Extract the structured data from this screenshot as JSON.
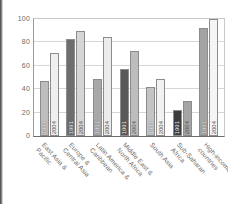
{
  "chart_data": {
    "type": "bar",
    "title": "",
    "xlabel": "",
    "ylabel": "",
    "ylim": [
      0,
      100
    ],
    "yticks": [
      0,
      20,
      40,
      60,
      80,
      100
    ],
    "grid": true,
    "legend_position": "none",
    "categories": [
      "East Asia &\nPacific",
      "Europe &\nCentral Asia",
      "Latin America &\nCaribbean",
      "Middle East &\nNorth Africa",
      "South Asia",
      "Sub-Saharan\nAfrica",
      "High-income\ncountries"
    ],
    "series": [
      {
        "name": "1991",
        "values": [
          47,
          83,
          49,
          57,
          42,
          22,
          92
        ],
        "colors": [
          "#bdbdbd",
          "#6e6e6e",
          "#a8a8a8",
          "#595959",
          "#c4c4c4",
          "#3d3d3d",
          "#a3a3a3"
        ]
      },
      {
        "name": "2004",
        "values": [
          71,
          90,
          85,
          73,
          49,
          30,
          100
        ],
        "colors": [
          "#efefef",
          "#d6d6d6",
          "#ececec",
          "#bdbdbd",
          "#f2f2f2",
          "#a5a5a5",
          "#f5f5f5"
        ]
      }
    ],
    "bar_inline_labels": [
      "1991",
      "2004"
    ]
  }
}
